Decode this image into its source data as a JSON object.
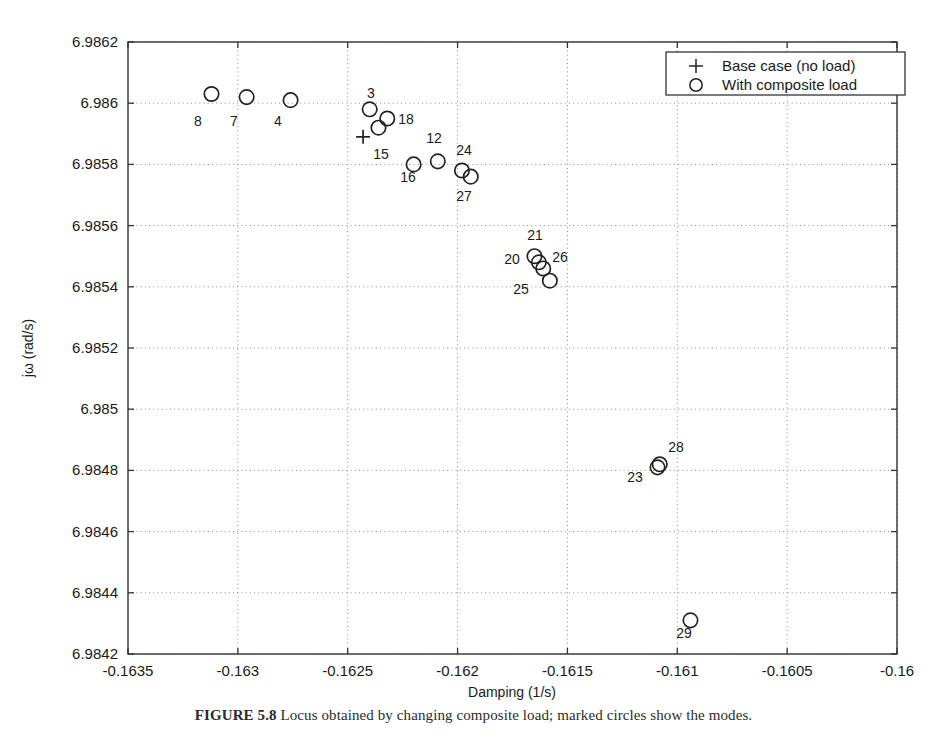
{
  "figure": {
    "caption_label": "FIGURE 5.8",
    "caption_text": "  Locus obtained by changing composite load; marked circles show the modes."
  },
  "axes": {
    "xlabel": "Damping (1/s)",
    "ylabel": "jω (rad/s)",
    "xticks": [
      "-0.1635",
      "-0.163",
      "-0.1625",
      "-0.162",
      "-0.1615",
      "-0.161",
      "-0.1605",
      "-0.16"
    ],
    "yticks": [
      "6.9842",
      "6.9844",
      "6.9846",
      "6.9848",
      "6.985",
      "6.9852",
      "6.9854",
      "6.9856",
      "6.9858",
      "6.986",
      "6.9862"
    ]
  },
  "legend": {
    "items": [
      {
        "marker": "plus-marker",
        "label": "Base case (no load)"
      },
      {
        "marker": "circle-marker",
        "label": "With composite load"
      }
    ]
  },
  "chart_data": {
    "type": "scatter",
    "title": "",
    "xlabel": "Damping (1/s)",
    "ylabel": "jω (rad/s)",
    "xlim": [
      -0.1635,
      -0.16
    ],
    "ylim": [
      6.9842,
      6.9862
    ],
    "xticks": [
      -0.1635,
      -0.163,
      -0.1625,
      -0.162,
      -0.1615,
      -0.161,
      -0.1605,
      -0.16
    ],
    "yticks": [
      6.9842,
      6.9844,
      6.9846,
      6.9848,
      6.985,
      6.9852,
      6.9854,
      6.9856,
      6.9858,
      6.986,
      6.9862
    ],
    "grid": true,
    "legend_position": "upper right",
    "series": [
      {
        "name": "Base case (no load)",
        "marker": "+",
        "points": [
          {
            "label": "",
            "x": -0.16243,
            "y": 6.98589
          }
        ]
      },
      {
        "name": "With composite load",
        "marker": "o",
        "points": [
          {
            "label": "8",
            "x": -0.16312,
            "y": 6.98603
          },
          {
            "label": "7",
            "x": -0.16296,
            "y": 6.98602
          },
          {
            "label": "4",
            "x": -0.16276,
            "y": 6.98601
          },
          {
            "label": "3",
            "x": -0.1624,
            "y": 6.98598
          },
          {
            "label": "15",
            "x": -0.16236,
            "y": 6.98592
          },
          {
            "label": "18",
            "x": -0.16232,
            "y": 6.98595
          },
          {
            "label": "16",
            "x": -0.1622,
            "y": 6.9858
          },
          {
            "label": "12",
            "x": -0.16209,
            "y": 6.98581
          },
          {
            "label": "24",
            "x": -0.16198,
            "y": 6.98578
          },
          {
            "label": "27",
            "x": -0.16194,
            "y": 6.98576
          },
          {
            "label": "21",
            "x": -0.16165,
            "y": 6.9855
          },
          {
            "label": "20",
            "x": -0.16163,
            "y": 6.98548
          },
          {
            "label": "26",
            "x": -0.16161,
            "y": 6.98546
          },
          {
            "label": "25",
            "x": -0.16158,
            "y": 6.98542
          },
          {
            "label": "23",
            "x": -0.16109,
            "y": 6.98481
          },
          {
            "label": "28",
            "x": -0.16108,
            "y": 6.98482
          },
          {
            "label": "29",
            "x": -0.16094,
            "y": 6.98431
          }
        ]
      }
    ],
    "point_labels": [
      {
        "text": "8",
        "px": 198,
        "py": 126
      },
      {
        "text": "7",
        "px": 234,
        "py": 126
      },
      {
        "text": "4",
        "px": 278,
        "py": 126
      },
      {
        "text": "3",
        "px": 371,
        "py": 98
      },
      {
        "text": "15",
        "px": 381,
        "py": 159
      },
      {
        "text": "18",
        "px": 406,
        "py": 124
      },
      {
        "text": "16",
        "px": 408,
        "py": 182
      },
      {
        "text": "12",
        "px": 434,
        "py": 143
      },
      {
        "text": "24",
        "px": 464,
        "py": 155
      },
      {
        "text": "27",
        "px": 464,
        "py": 201
      },
      {
        "text": "21",
        "px": 535,
        "py": 240
      },
      {
        "text": "20",
        "px": 512,
        "py": 264
      },
      {
        "text": "26",
        "px": 560,
        "py": 262
      },
      {
        "text": "25",
        "px": 521,
        "py": 294
      },
      {
        "text": "23",
        "px": 635,
        "py": 482
      },
      {
        "text": "28",
        "px": 676,
        "py": 452
      },
      {
        "text": "29",
        "px": 684,
        "py": 638
      }
    ]
  }
}
